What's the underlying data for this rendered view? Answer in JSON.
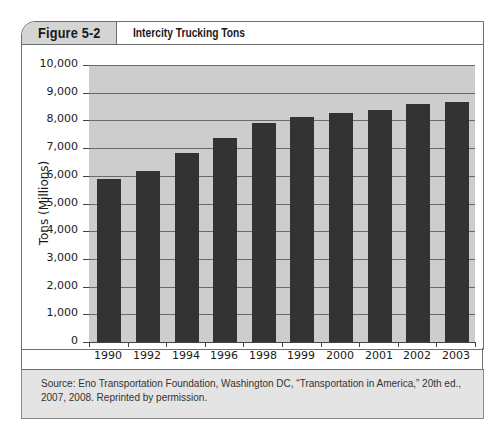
{
  "figure": {
    "label": "Figure 5-2",
    "title": "Intercity Trucking Tons"
  },
  "axis": {
    "ylabel": "Tons (Millions)",
    "yticks": [
      "10,000",
      "9,000",
      "8,000",
      "7,000",
      "6,000",
      "5,000",
      "4,000",
      "3,000",
      "2,000",
      "1,000",
      "0"
    ]
  },
  "source": {
    "text": "Source: Eno Transportation Foundation, Washington DC, “Transportation in America,” 20th ed., 2007, 2008. Reprinted by permission."
  },
  "colors": {
    "bar": "#333333",
    "plot_bg": "#cdcdcd",
    "header_tab": "#d4d4d4",
    "source_bg": "#e4e4e4"
  },
  "chart_data": {
    "type": "bar",
    "title": "Intercity Trucking Tons",
    "xlabel": "",
    "ylabel": "Tons (Millions)",
    "categories": [
      "1990",
      "1992",
      "1994",
      "1996",
      "1998",
      "1999",
      "2000",
      "2001",
      "2002",
      "2003"
    ],
    "values": [
      5880,
      6170,
      6820,
      7360,
      7900,
      8120,
      8270,
      8380,
      8590,
      8660
    ],
    "ylim": [
      0,
      10000
    ],
    "ytick_step": 1000,
    "grid": true,
    "legend": null
  }
}
